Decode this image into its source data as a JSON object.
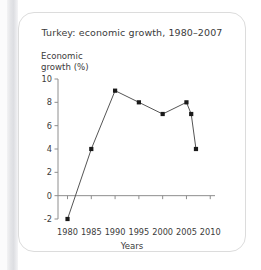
{
  "figure": {
    "title": "Turkey: economic growth, 1980–2007",
    "ylabel": "Economic\ngrowth (%)",
    "xlabel": "Years",
    "text_color": "#3b3b3b",
    "line_color": "#555555",
    "marker_color": "#1a1a1a",
    "axis_color": "#8e8e8e",
    "card_background": "#ffffff",
    "card_border": "#dcdcdc",
    "page_background": "#ffffff"
  },
  "chart_data": {
    "type": "line",
    "title": "Turkey: economic growth, 1980–2007",
    "xlabel": "Years",
    "ylabel": "Economic growth (%)",
    "x": [
      1980,
      1985,
      1990,
      1995,
      2000,
      2005,
      2006,
      2007
    ],
    "values": [
      -2,
      4,
      9,
      8,
      7,
      8,
      7,
      4
    ],
    "series": [
      {
        "name": "Economic growth (%)",
        "values": [
          -2,
          4,
          9,
          8,
          7,
          8,
          7,
          4
        ]
      }
    ],
    "xlim": [
      1978,
      2011
    ],
    "ylim": [
      -2,
      10
    ],
    "xticks": [
      1980,
      1985,
      1990,
      1995,
      2000,
      2005,
      2010
    ],
    "xtick_labels": [
      "1980",
      "1985",
      "1990",
      "1995",
      "2000",
      "2005",
      "2010"
    ],
    "yticks": [
      -2,
      0,
      2,
      4,
      6,
      8,
      10
    ],
    "ytick_labels": [
      "-2",
      "0",
      "2",
      "4",
      "6",
      "8",
      "10"
    ],
    "grid": false,
    "legend": false,
    "marker": "square"
  }
}
